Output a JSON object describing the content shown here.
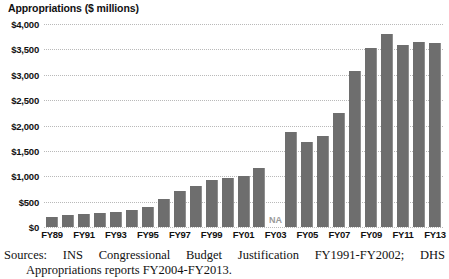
{
  "chart_data": {
    "type": "bar",
    "title": "Appropriations ($ millions)",
    "xlabel": "",
    "ylabel": "Appropriations ($ millions)",
    "ylim": [
      0,
      4000
    ],
    "ytick_step": 500,
    "ytick_labels": [
      "$4,000",
      "$3,500",
      "$3,000",
      "$2,500",
      "$2,000",
      "$1,500",
      "$1,000",
      "$500",
      "$0"
    ],
    "ytick_values": [
      4000,
      3500,
      3000,
      2500,
      2000,
      1500,
      1000,
      500,
      0
    ],
    "grid": true,
    "legend": "none",
    "categories": [
      "FY89",
      "FY90",
      "FY91",
      "FY92",
      "FY93",
      "FY94",
      "FY95",
      "FY96",
      "FY97",
      "FY98",
      "FY99",
      "FY00",
      "FY01",
      "FY02",
      "FY03",
      "FY04",
      "FY05",
      "FY06",
      "FY07",
      "FY08",
      "FY09",
      "FY10",
      "FY11",
      "FY12",
      "FY13"
    ],
    "values": [
      200,
      230,
      260,
      270,
      290,
      330,
      390,
      560,
      700,
      810,
      930,
      960,
      1010,
      1170,
      null,
      1880,
      1680,
      1800,
      2250,
      3080,
      3520,
      3800,
      3580,
      3650,
      3620
    ],
    "missing_label": "NA",
    "missing_category": "FY03",
    "xtick_labels_shown": [
      "FY89",
      "FY91",
      "FY93",
      "FY95",
      "FY97",
      "FY99",
      "FY01",
      "FY03",
      "FY05",
      "FY07",
      "FY09",
      "FY11",
      "FY13"
    ],
    "bar_color": "#6e6e6e",
    "gridline_color": "#b9b9b9",
    "background_color": "#ffffff"
  },
  "source": {
    "line1": "Sources: INS Congressional Budget Justification FY1991-FY2002; DHS",
    "line2": "Appropriations reports FY2004-FY2013."
  }
}
